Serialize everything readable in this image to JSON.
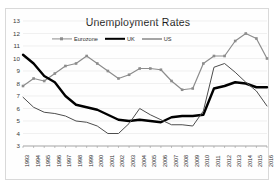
{
  "chart_data": {
    "type": "line",
    "title": "Unemployment Rates",
    "xlabel": "",
    "ylabel": "",
    "ylim": [
      3,
      13
    ],
    "yticks": [
      13,
      12,
      11,
      10,
      9,
      8,
      7,
      6,
      5,
      4,
      3
    ],
    "grid": true,
    "legend_position": "top-left-inside",
    "categories": [
      "1993",
      "1994",
      "1995",
      "1996",
      "1997",
      "1998",
      "1999",
      "2000",
      "2001",
      "2002",
      "2003",
      "2004",
      "2005",
      "2006",
      "2007",
      "2008",
      "2009",
      "2010",
      "2011",
      "2012",
      "2013",
      "2014",
      "2015",
      "2016"
    ],
    "series": [
      {
        "name": "Eurozone",
        "color": "#8c8c8c",
        "marker": "square",
        "line_width": 1.2,
        "values": [
          7.8,
          8.4,
          8.2,
          8.8,
          9.4,
          9.6,
          10.2,
          9.6,
          9.0,
          8.4,
          8.7,
          9.2,
          9.2,
          9.1,
          8.2,
          7.5,
          7.6,
          9.6,
          10.2,
          10.2,
          11.4,
          12.0,
          11.6,
          11.0
        ],
        "last_value": 10.0
      },
      {
        "name": "UK",
        "color": "#000000",
        "marker": "none",
        "line_width": 2.4,
        "values": [
          10.3,
          9.6,
          8.6,
          8.1,
          7.0,
          6.3,
          6.1,
          5.9,
          5.5,
          5.1,
          5.0,
          5.1,
          5.0,
          4.9,
          5.3,
          5.4,
          5.4,
          5.5,
          7.6,
          7.8,
          8.1,
          8.0,
          7.7,
          7.7
        ]
      },
      {
        "name": "US",
        "color": "#4d4d4d",
        "marker": "none",
        "line_width": 1.0,
        "values": [
          6.9,
          6.1,
          5.7,
          5.6,
          5.4,
          5.0,
          4.9,
          4.6,
          4.0,
          4.0,
          4.8,
          6.0,
          5.5,
          5.1,
          4.7,
          4.7,
          4.6,
          5.8,
          9.3,
          9.6,
          8.9,
          8.1,
          7.4,
          6.2
        ]
      }
    ]
  },
  "legend": {
    "entries": [
      {
        "label": "Eurozone"
      },
      {
        "label": "UK"
      },
      {
        "label": "US"
      }
    ]
  }
}
